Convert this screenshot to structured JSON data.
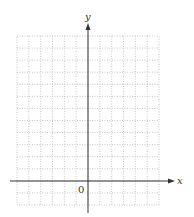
{
  "diagram": {
    "type": "coordinate-grid",
    "axes": {
      "x_label": "x",
      "y_label": "y",
      "origin_label": "0"
    },
    "grid": {
      "columns": 12,
      "rows": 14,
      "style": "dotted",
      "line_color": "#b8b8b8",
      "axis_color": "#333333"
    }
  }
}
